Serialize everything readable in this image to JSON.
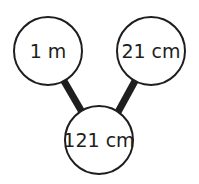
{
  "diagram": {
    "type": "tree",
    "colors": {
      "stroke": "#1e1e1e",
      "fill": "#ffffff",
      "text": "#1e1e1e"
    },
    "nodes": [
      {
        "id": "left",
        "label": "1 m",
        "cx": 48,
        "cy": 51,
        "r": 34
      },
      {
        "id": "right",
        "label": "21 cm",
        "cx": 151,
        "cy": 51,
        "r": 34
      },
      {
        "id": "bottom",
        "label": "121 cm",
        "cx": 99,
        "cy": 140,
        "r": 34
      }
    ],
    "edges": [
      {
        "from": "left",
        "to": "bottom"
      },
      {
        "from": "right",
        "to": "bottom"
      }
    ]
  }
}
